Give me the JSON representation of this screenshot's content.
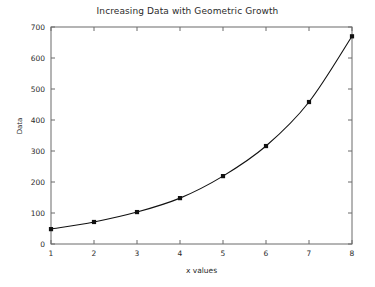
{
  "chart_data": {
    "type": "line",
    "title": "Increasing Data with Geometric Growth",
    "xlabel": "x values",
    "ylabel": "Data",
    "x": [
      1,
      2,
      3,
      4,
      5,
      6,
      7,
      8
    ],
    "values": [
      48,
      71,
      103,
      148,
      219,
      316,
      458,
      670
    ],
    "series": [
      {
        "name": "Data",
        "values": [
          48,
          71,
          103,
          148,
          219,
          316,
          458,
          670
        ],
        "marker": "filled-square",
        "color": "#111111"
      }
    ],
    "xlim": [
      1,
      8
    ],
    "ylim": [
      0,
      700
    ],
    "xticks": [
      1,
      2,
      3,
      4,
      5,
      6,
      7,
      8
    ],
    "yticks": [
      0,
      100,
      200,
      300,
      400,
      500,
      600,
      700
    ],
    "xtick_labels": [
      "1",
      "2",
      "3",
      "4",
      "5",
      "6",
      "7",
      "8"
    ],
    "ytick_labels": [
      "0",
      "100",
      "200",
      "300",
      "400",
      "500",
      "600",
      "700"
    ],
    "grid": false,
    "legend": false,
    "legend_position": "none",
    "line_color": "#111111",
    "frame_color": "#6b6b6b",
    "background": "#ffffff"
  }
}
